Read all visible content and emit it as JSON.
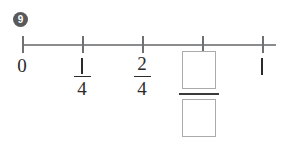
{
  "worksheet": {
    "question_number": "9",
    "background_color": "#ffffff",
    "line_color": "#8a8c8e",
    "tick_color": "#6f7173",
    "text_color": "#2b2b2b",
    "box_border_color": "#a9abad",
    "badge_color": "#58595b"
  },
  "number_line": {
    "label": "number-line",
    "ticks": [
      {
        "id": "tick-0",
        "x": 22,
        "label_type": "whole",
        "label": "0"
      },
      {
        "id": "tick-1-4",
        "x": 82,
        "label_type": "fraction",
        "numerator": "1",
        "denominator": "4"
      },
      {
        "id": "tick-2-4",
        "x": 142,
        "label_type": "fraction",
        "numerator": "2",
        "denominator": "4"
      },
      {
        "id": "tick-blank",
        "x": 202,
        "label_type": "answer",
        "numerator": "",
        "denominator": ""
      },
      {
        "id": "tick-1",
        "x": 262,
        "label_type": "whole",
        "label": "1"
      }
    ],
    "axis_start_x": 22,
    "axis_end_x": 276,
    "axis_y": 44
  },
  "answer": {
    "numerator_value": "",
    "denominator_value": "",
    "numerator_placeholder": "",
    "denominator_placeholder": ""
  }
}
